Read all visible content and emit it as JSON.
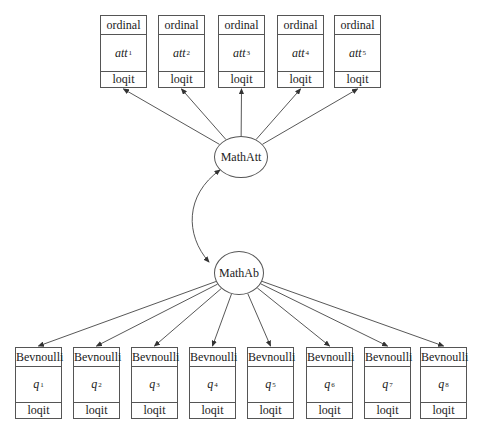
{
  "top_indicators": [
    {
      "type": "ordinal",
      "var": "att",
      "sub": "1",
      "link": "loqit",
      "x": 100,
      "w": 47
    },
    {
      "type": "ordinal",
      "var": "att",
      "sub": "2",
      "link": "loqit",
      "x": 158,
      "w": 47
    },
    {
      "type": "ordinal",
      "var": "att",
      "sub": "3",
      "link": "loqit",
      "x": 218,
      "w": 47
    },
    {
      "type": "ordinal",
      "var": "att",
      "sub": "4",
      "link": "loqit",
      "x": 277,
      "w": 47
    },
    {
      "type": "ordinal",
      "var": "att",
      "sub": "5",
      "link": "loqit",
      "x": 334,
      "w": 47
    }
  ],
  "latent": {
    "att": {
      "label": "MathAtt",
      "cx": 241,
      "cy": 157,
      "rx": 27,
      "ry": 21
    },
    "ab": {
      "label": "MathAb",
      "cx": 239,
      "cy": 273,
      "rx": 25,
      "ry": 22
    }
  },
  "bottom_indicators": [
    {
      "type": "Bevnoulli",
      "var": "q",
      "sub": "1",
      "link": "loqit",
      "x": 15,
      "w": 47
    },
    {
      "type": "Bevnoulli",
      "var": "q",
      "sub": "2",
      "link": "loqit",
      "x": 73,
      "w": 47
    },
    {
      "type": "Bevnoulli",
      "var": "q",
      "sub": "3",
      "link": "loqit",
      "x": 131,
      "w": 47
    },
    {
      "type": "Bevnoulli",
      "var": "q",
      "sub": "4",
      "link": "loqit",
      "x": 189,
      "w": 47
    },
    {
      "type": "Bevnoulli",
      "var": "q",
      "sub": "5",
      "link": "loqit",
      "x": 247,
      "w": 47
    },
    {
      "type": "Bevnoulli",
      "var": "q",
      "sub": "6",
      "link": "loqit",
      "x": 306,
      "w": 47
    },
    {
      "type": "Bevnoulli",
      "var": "q",
      "sub": "7",
      "link": "loqit",
      "x": 364,
      "w": 47
    },
    {
      "type": "Bevnoulli",
      "var": "q",
      "sub": "8",
      "link": "loqit",
      "x": 420,
      "w": 47
    }
  ],
  "covariance": {
    "from": "MathAtt",
    "to": "MathAb",
    "bidirectional": true
  },
  "colors": {
    "stroke": "#555555",
    "text": "#222222",
    "background": "#ffffff"
  }
}
